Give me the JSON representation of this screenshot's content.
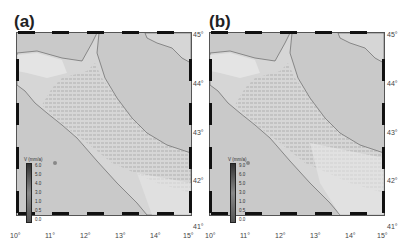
{
  "figure": {
    "panels": [
      {
        "label": "(a)",
        "colorbar": {
          "title": "V (mm/a)",
          "ticks": [
            "6.0",
            "5.0",
            "4.0",
            "3.0",
            "1.0",
            "0.5",
            "0.0"
          ]
        }
      },
      {
        "label": "(b)",
        "colorbar": {
          "title": "V (mm/a)",
          "ticks": [
            "9.0",
            "6.0",
            "5.0",
            "3.0",
            "1.0",
            "0.5",
            "0.0"
          ]
        }
      }
    ],
    "x_ticks": [
      "10°",
      "11°",
      "12°",
      "13°",
      "14°",
      "15°"
    ],
    "y_ticks": [
      "45°",
      "44°",
      "43°",
      "42°",
      "41°"
    ],
    "colors": {
      "sea": "#c9c9c9",
      "land": "#d8d8d8",
      "frame": "#111111",
      "vectors": "#777777"
    }
  }
}
